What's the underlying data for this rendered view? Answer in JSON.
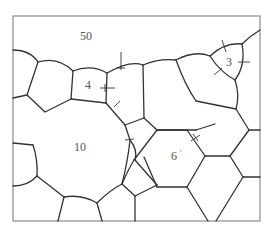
{
  "diagram": {
    "type": "grain-boundary-schematic",
    "grain_labels": [
      {
        "id": "grain-50",
        "text": "50",
        "x": 80,
        "y": 40
      },
      {
        "id": "grain-4",
        "text": "4",
        "x": 85,
        "y": 89
      },
      {
        "id": "grain-3",
        "text": "3",
        "x": 226,
        "y": 66
      },
      {
        "id": "grain-10",
        "text": "10",
        "x": 74,
        "y": 151
      },
      {
        "id": "grain-6",
        "text": "6",
        "x": 171,
        "y": 160
      },
      {
        "id": "grain-6-prime",
        "text": "'",
        "x": 180,
        "y": 156
      }
    ],
    "colors": {
      "boundary": "#333333",
      "frame": "#8a8a8a",
      "label": "#555555",
      "background": "#ffffff"
    }
  }
}
